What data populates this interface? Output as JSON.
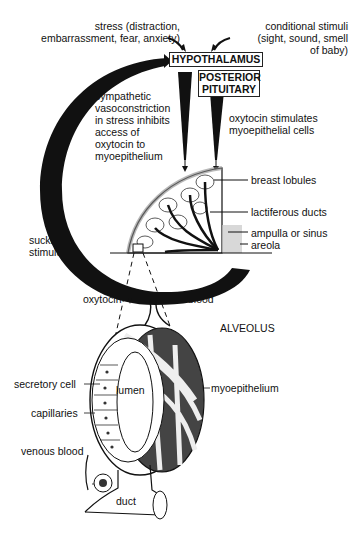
{
  "diagram": {
    "top_labels": {
      "stress": [
        "stress (distraction,",
        "embarrassment, fear, anxiety)"
      ],
      "conditional": [
        "conditional stimuli",
        "(sight, sound, smell",
        "of baby)"
      ]
    },
    "boxes": {
      "hypothalamus": "HYPOTHALAMUS",
      "posterior_pituitary": [
        "POSTERIOR",
        "PITUITARY"
      ]
    },
    "middle_labels": {
      "sympathetic": [
        "sympathetic",
        "vasoconstriction",
        "in stress inhibits",
        "access of",
        "oxytocin to",
        "myoepithelium"
      ],
      "oxytocin_stimulates": [
        "oxytocin stimulates",
        "myoepithelial cells"
      ],
      "sucking": [
        "sucking",
        "stimulus"
      ]
    },
    "breast_labels": {
      "lobules": "breast lobules",
      "ducts": "lactiferous ducts",
      "ampulla": "ampulla or sinus",
      "areola": "areola"
    },
    "alveolus_labels": {
      "title": "ALVEOLUS",
      "oxytocin": "oxytocin",
      "arterial": "arterial blood",
      "secretory": "secretory cell",
      "lumen": "lumen",
      "myoepithelium": "myoepithelium",
      "capillaries": "capillaries",
      "venous": "venous blood",
      "duct": "duct"
    },
    "colors": {
      "ink": "#111111",
      "background": "#ffffff",
      "shade": "#c8c8c8"
    }
  }
}
